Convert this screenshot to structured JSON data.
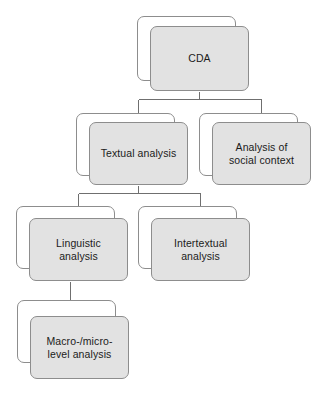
{
  "diagram": {
    "type": "tree",
    "style": {
      "card_fill": "#e2e2e2",
      "card_back_fill": "#ffffff",
      "card_border": "#8d8d8d",
      "connector_color": "#6f6f6f",
      "text_color": "#1b1b1b",
      "background": "#ffffff"
    },
    "nodes": [
      {
        "id": "cda",
        "label": "CDA",
        "level": 0,
        "back": {
          "x": 137,
          "y": 16,
          "w": 99,
          "h": 65
        },
        "front": {
          "x": 150,
          "y": 26,
          "w": 99,
          "h": 65
        }
      },
      {
        "id": "textual-analysis",
        "label": "Textual analysis",
        "level": 1,
        "back": {
          "x": 76,
          "y": 113,
          "w": 99,
          "h": 63
        },
        "front": {
          "x": 89,
          "y": 122,
          "w": 99,
          "h": 63
        }
      },
      {
        "id": "analysis-of-social-context",
        "label": "Analysis of\nsocial context",
        "level": 1,
        "back": {
          "x": 199,
          "y": 113,
          "w": 99,
          "h": 63
        },
        "front": {
          "x": 212,
          "y": 122,
          "w": 99,
          "h": 63
        }
      },
      {
        "id": "linguistic-analysis",
        "label": "Linguistic\nanalysis",
        "level": 2,
        "back": {
          "x": 16,
          "y": 206,
          "w": 99,
          "h": 63
        },
        "front": {
          "x": 29,
          "y": 218,
          "w": 99,
          "h": 63
        }
      },
      {
        "id": "intertextual-analysis",
        "label": "Intertextual\nanalysis",
        "level": 2,
        "back": {
          "x": 138,
          "y": 206,
          "w": 99,
          "h": 63
        },
        "front": {
          "x": 151,
          "y": 218,
          "w": 99,
          "h": 63
        }
      },
      {
        "id": "macro-micro-level-analysis",
        "label": "Macro-/micro-\nlevel analysis",
        "level": 3,
        "back": {
          "x": 17,
          "y": 300,
          "w": 99,
          "h": 63
        },
        "front": {
          "x": 30,
          "y": 316,
          "w": 99,
          "h": 63
        }
      }
    ],
    "edges": [
      {
        "id": "cda-to-textual",
        "from": "cda",
        "to": "textual-analysis"
      },
      {
        "id": "cda-to-social-context",
        "from": "cda",
        "to": "analysis-of-social-context"
      },
      {
        "id": "textual-to-linguistic",
        "from": "textual-analysis",
        "to": "linguistic-analysis"
      },
      {
        "id": "textual-to-intertextual",
        "from": "textual-analysis",
        "to": "intertextual-analysis"
      },
      {
        "id": "linguistic-to-macro-micro",
        "from": "linguistic-analysis",
        "to": "macro-micro-level-analysis"
      }
    ]
  }
}
